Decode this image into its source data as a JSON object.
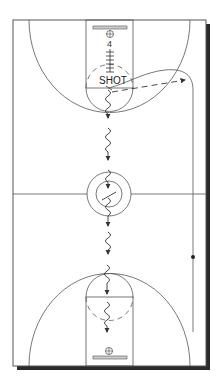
{
  "diagram": {
    "type": "basketball-half-court-play",
    "shot_label": "SHOT",
    "player_number": "4",
    "colors": {
      "line": "#555555",
      "shadow": "#2a2a2a",
      "background": "#ffffff",
      "backboard": "#cccccc"
    }
  }
}
